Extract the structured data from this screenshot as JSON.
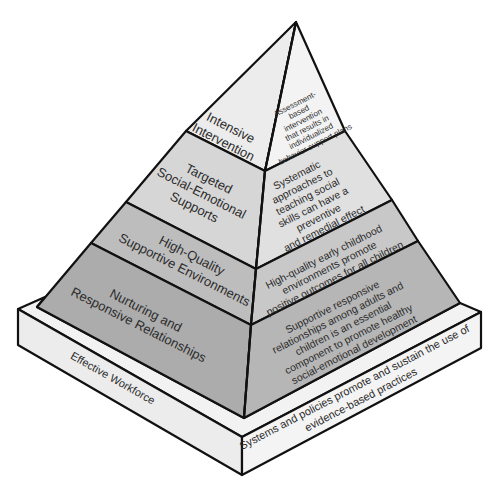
{
  "diagram": {
    "type": "pyramid",
    "colors": {
      "tier_top": "#ececec",
      "tier_targeted": "#d6d6d6",
      "tier_high_quality": "#bdbdbd",
      "tier_nurturing": "#acacac",
      "base_light": "#f2f2f2",
      "base_side": "#e6e6e6",
      "outline": "#111111"
    },
    "tiers": [
      {
        "left_lines": [
          "Intensive",
          "Intervention"
        ],
        "right_lines": [
          "Assessment-",
          "based",
          "intervention",
          "that results in",
          "individualized",
          "behavior support plans"
        ]
      },
      {
        "left_lines": [
          "Targeted",
          "Social-Emotional",
          "Supports"
        ],
        "right_lines": [
          "Systematic",
          "approaches to",
          "teaching social",
          "skills can have a",
          "preventive",
          "and remedial effect"
        ]
      },
      {
        "left_lines": [
          "High-Quality",
          "Supportive Environments"
        ],
        "right_lines": [
          "High-quality early childhood",
          "environments promote",
          "positive outcomes for all children"
        ]
      },
      {
        "left_lines": [
          "Nurturing and",
          "Responsive Relationships"
        ],
        "right_lines": [
          "Supportive responsive",
          "relationships among adults and",
          "children is an essential",
          "component to promote healthy",
          "social-emotional development"
        ]
      }
    ],
    "base": {
      "left_label": "Effective Workforce",
      "right_lines": [
        "Systems and policies promote and sustain the use of",
        "evidence-based practices"
      ]
    }
  }
}
